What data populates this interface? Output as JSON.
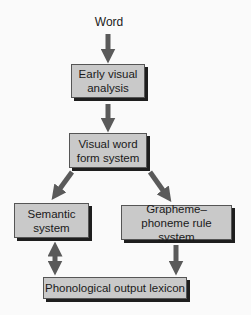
{
  "diagram": {
    "input_label": "Word",
    "nodes": {
      "early_visual": "Early visual analysis",
      "visual_word_form": "Visual word form system",
      "semantic": "Semantic system",
      "grapheme_phoneme": "Grapheme–phoneme rule system",
      "phonological_output": "Phonological output lexicon"
    },
    "edges": [
      {
        "from": "Word",
        "to": "Early visual analysis",
        "type": "single"
      },
      {
        "from": "Early visual analysis",
        "to": "Visual word form system",
        "type": "single"
      },
      {
        "from": "Visual word form system",
        "to": "Semantic system",
        "type": "single"
      },
      {
        "from": "Visual word form system",
        "to": "Grapheme–phoneme rule system",
        "type": "single"
      },
      {
        "from": "Semantic system",
        "to": "Phonological output lexicon",
        "type": "bidirectional"
      },
      {
        "from": "Grapheme–phoneme rule system",
        "to": "Phonological output lexicon",
        "type": "single"
      }
    ],
    "colors": {
      "box_fill": "#c9c9c9",
      "box_shadow": "#1e1e1e",
      "arrow": "#5a5a5a",
      "background": "#fafafa"
    }
  }
}
